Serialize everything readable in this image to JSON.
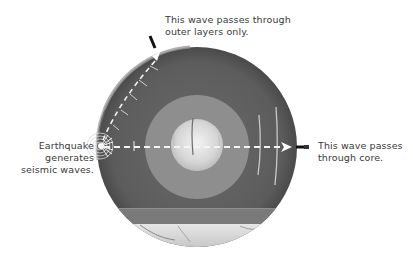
{
  "diagram": {
    "labels": {
      "top_line1": "This wave passes through",
      "top_line2": "outer layers only.",
      "left_line1": "Earthquake",
      "left_line2": "generates",
      "left_line3": "seismic waves.",
      "right_line1": "This wave passes",
      "right_line2": "through core."
    },
    "layers": [
      {
        "name": "crust-mantle",
        "color": "#5a5a5a"
      },
      {
        "name": "outer-core",
        "color": "#8c8c8c"
      },
      {
        "name": "inner-core",
        "color": "#d8d8d8"
      }
    ],
    "waves": [
      {
        "name": "surface-wave",
        "path": "curved along outer layers",
        "arrow_color": "#ffffff"
      },
      {
        "name": "core-wave",
        "path": "straight through core",
        "arrow_color": "#ffffff"
      }
    ]
  }
}
